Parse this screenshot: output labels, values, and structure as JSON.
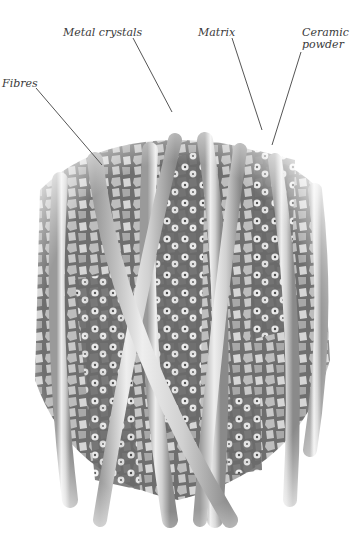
{
  "diagram": {
    "labels": [
      {
        "id": "metal-crystals",
        "text": "Metal crystals"
      },
      {
        "id": "matrix",
        "text": "Matrix"
      },
      {
        "id": "ceramic-powder",
        "text": "Ceramic powder",
        "lines": [
          "Ceramic",
          "powder"
        ]
      },
      {
        "id": "fibres",
        "text": "Fibres"
      }
    ]
  },
  "colors": {
    "matrix": "#6e6e6e",
    "crystal": "#bdbdbd",
    "crystal_light": "#dcdcdc",
    "fibre": "#d2d2d2",
    "powder": "#f2f2f2",
    "leader_line": "#555555"
  }
}
